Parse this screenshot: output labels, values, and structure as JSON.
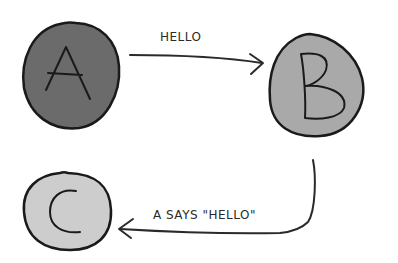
{
  "diagram": {
    "nodes": [
      {
        "id": "A",
        "label": "A",
        "fill": "#6b6b6b"
      },
      {
        "id": "B",
        "label": "B",
        "fill": "#a9a9a9"
      },
      {
        "id": "C",
        "label": "C",
        "fill": "#cdcdcd"
      }
    ],
    "edges": [
      {
        "from": "A",
        "to": "B",
        "label": "HELLO"
      },
      {
        "from": "B",
        "to": "C",
        "label": "A SAYS \"HELLO\""
      }
    ],
    "colors": {
      "stroke": "#1a1a1a",
      "background": "#ffffff"
    }
  }
}
